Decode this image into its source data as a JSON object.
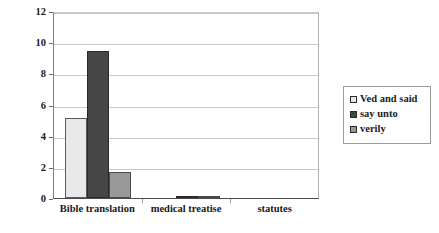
{
  "chart_data": {
    "type": "bar",
    "title": "",
    "xlabel": "",
    "ylabel": "",
    "categories": [
      "Bible translation",
      "medical treatise",
      "statutes"
    ],
    "series": [
      {
        "name": "Ved and said",
        "color": "#e8e8e8",
        "values": [
          5.15,
          0.0,
          0.0
        ]
      },
      {
        "name": "say unto",
        "color": "#464646",
        "values": [
          9.45,
          0.15,
          0.0
        ]
      },
      {
        "name": "verily",
        "color": "#999999",
        "values": [
          1.65,
          0.08,
          0.0
        ]
      }
    ],
    "ylim": [
      0,
      12
    ],
    "yticks": [
      0,
      2,
      4,
      6,
      8,
      10,
      12
    ],
    "ytick_labels": [
      "0",
      "2",
      "4",
      "6",
      "8",
      "10",
      "12"
    ],
    "grid": true,
    "legend_position": "right"
  },
  "legend": {
    "items": [
      {
        "label": "Ved and said",
        "swatch": "legend-swatch-ved-and-said"
      },
      {
        "label": "say unto",
        "swatch": "legend-swatch-say-unto"
      },
      {
        "label": "verily",
        "swatch": "legend-swatch-verily"
      }
    ]
  }
}
